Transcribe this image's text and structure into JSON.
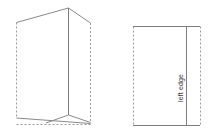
{
  "diagram": {
    "background_color": "#ffffff",
    "line_color": "#8a8a8a",
    "solid_line_color": "#7d7d7d",
    "dashed_line_color": "#9a9a9a",
    "label_color": "#3a3a3a",
    "figures": [
      {
        "id": "perspective-view",
        "name": "folded-card-perspective",
        "description": "Open folded card shown in three-quarter perspective with vertical center fold",
        "labels": []
      },
      {
        "id": "flat-view",
        "name": "folded-card-flat",
        "description": "Flat rectangular card outline with vertical fold line near right side",
        "labels": [
          {
            "text": "left edge",
            "orientation": "vertical",
            "rotation_degrees": -90,
            "position": "inside-right-panel"
          }
        ]
      }
    ]
  },
  "labels": {
    "left_edge": "left edge"
  }
}
